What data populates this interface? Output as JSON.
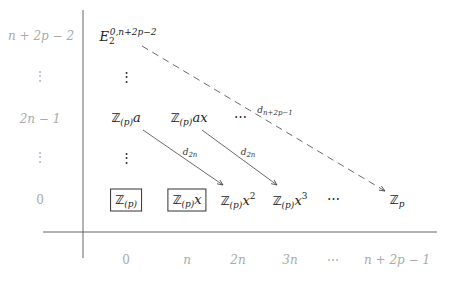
{
  "y_axis_labels": [
    "n + 2p − 2",
    "⋮",
    "2n − 1",
    "⋮",
    "0"
  ],
  "x_axis_labels": [
    "0",
    "n",
    "2n",
    "3n",
    "⋯",
    "n + 2p − 1"
  ],
  "entries": {
    "top": {
      "base": "E",
      "sub": "2",
      "sup": "0,n+2p−2"
    },
    "vdots": "⋮",
    "row_2n1": [
      {
        "ring": "ℤ",
        "sub": "(p)",
        "var": "a"
      },
      {
        "ring": "ℤ",
        "sub": "(p)",
        "var": "ax"
      },
      {
        "text": "⋯"
      }
    ],
    "row_0": [
      {
        "ring": "ℤ",
        "sub": "(p)",
        "var": "",
        "boxed": true
      },
      {
        "ring": "ℤ",
        "sub": "(p)",
        "var": "x",
        "boxed": true
      },
      {
        "ring": "ℤ",
        "sub": "(p)",
        "var": "x",
        "exp": "2"
      },
      {
        "ring": "ℤ",
        "sub": "(p)",
        "var": "x",
        "exp": "3"
      },
      {
        "text": "⋯"
      },
      {
        "ring": "ℤ",
        "sub": "p"
      }
    ]
  },
  "differentials": [
    {
      "label_base": "d",
      "label_sub": "2n",
      "style": "solid"
    },
    {
      "label_base": "d",
      "label_sub": "2n",
      "style": "solid"
    },
    {
      "label_base": "d",
      "label_sub": "n+2p−1",
      "style": "dashed"
    }
  ]
}
